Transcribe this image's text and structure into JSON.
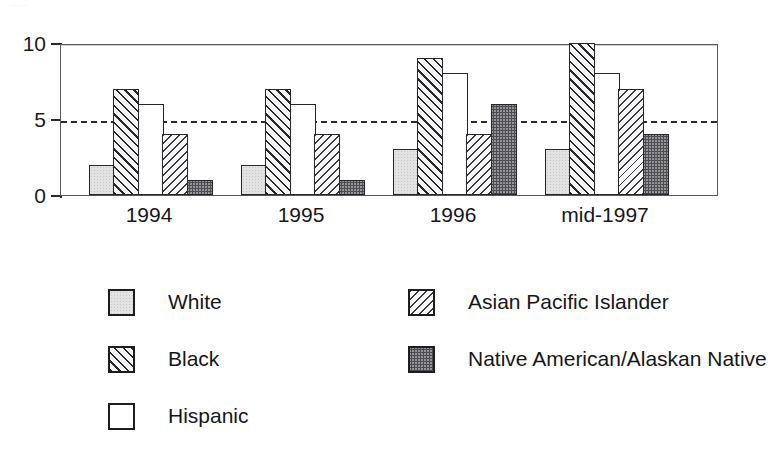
{
  "artifact": {
    "clipped_top_text": "....."
  },
  "chart_data": {
    "type": "bar",
    "title": "",
    "subtitle": "",
    "xlabel": "",
    "ylabel": "",
    "ylim": [
      0,
      10
    ],
    "yticks": [
      0,
      5,
      10
    ],
    "ytick_labels": [
      "0",
      "5",
      "10"
    ],
    "grid": false,
    "reference_line": {
      "value": 5,
      "style": "dashed",
      "color": "#2b2b2e"
    },
    "legend_position": "below",
    "categories": [
      "1994",
      "1995",
      "1996",
      "mid-1997"
    ],
    "series": [
      {
        "name": "White",
        "pattern": "light-gray-solid",
        "color": "#e3e3e3",
        "values": [
          2,
          2,
          3,
          3
        ]
      },
      {
        "name": "Black",
        "pattern": "diagonal-hatch-forward",
        "color": "#26262b",
        "values": [
          7,
          7,
          9,
          10
        ]
      },
      {
        "name": "Hispanic",
        "pattern": "empty-white",
        "color": "#ffffff",
        "values": [
          6,
          6,
          8,
          8
        ]
      },
      {
        "name": "Asian Pacific Islander",
        "pattern": "diagonal-hatch-back-fine",
        "color": "#3a3a40",
        "values": [
          4,
          4,
          4,
          7
        ]
      },
      {
        "name": "Native American/Alaskan Native",
        "pattern": "dark-stipple",
        "color": "#4a4a50",
        "values": [
          1,
          1,
          6,
          4
        ]
      }
    ]
  },
  "axis": {
    "y_labels": [
      "10",
      "5",
      "0"
    ]
  },
  "legend": {
    "columns": [
      {
        "items": [
          {
            "label": "White",
            "swatch": "fill-white"
          },
          {
            "label": "Black",
            "swatch": "fill-black"
          },
          {
            "label": "Hispanic",
            "swatch": "fill-hispanic"
          }
        ]
      },
      {
        "items": [
          {
            "label": "Asian Pacific Islander",
            "swatch": "fill-asian"
          },
          {
            "label": "Native American/Alaskan Native",
            "swatch": "fill-native"
          }
        ]
      }
    ]
  }
}
